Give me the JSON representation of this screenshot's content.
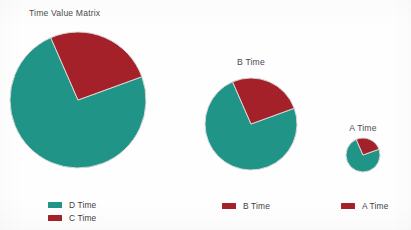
{
  "page": {
    "background": "#fefefe",
    "width": 411,
    "height": 230
  },
  "title": "Time Value Matrix",
  "colors": {
    "teal": "#1f9487",
    "red": "#a5212a",
    "text": "#4c4c4c",
    "wedge_edge": "#d8d8d8"
  },
  "chart_data": {
    "type": "pie",
    "title": "Time Value Matrix",
    "legend_position": "bottom",
    "charts": [
      {
        "name": "pie-d-time",
        "label": "",
        "radius": 68,
        "cx": 78,
        "cy": 100,
        "start_angle": -20,
        "slices": [
          {
            "label": "D Time",
            "value": 74,
            "color": "#1f9487"
          },
          {
            "label": "C Time",
            "value": 26,
            "color": "#a5212a"
          }
        ],
        "legend": [
          {
            "label": "D Time",
            "color": "#1f9487"
          },
          {
            "label": "C Time",
            "color": "#a5212a"
          }
        ]
      },
      {
        "name": "pie-b-time",
        "label": "B Time",
        "radius": 46,
        "cx": 251,
        "cy": 124,
        "start_angle": -20,
        "slices": [
          {
            "label": "B Time Remainder",
            "value": 74,
            "color": "#1f9487"
          },
          {
            "label": "B Time",
            "value": 26,
            "color": "#a5212a"
          }
        ],
        "legend": [
          {
            "label": "B Time",
            "color": "#a5212a"
          }
        ]
      },
      {
        "name": "pie-a-time",
        "label": "A Time",
        "radius": 17,
        "cx": 363,
        "cy": 155,
        "start_angle": -20,
        "slices": [
          {
            "label": "A Time Remainder",
            "value": 74,
            "color": "#1f9487"
          },
          {
            "label": "A Time",
            "value": 26,
            "color": "#a5212a"
          }
        ],
        "legend": [
          {
            "label": "A Time",
            "color": "#a5212a"
          }
        ]
      }
    ]
  },
  "labels": {
    "pie_b": "B Time",
    "pie_a": "A Time"
  },
  "legends": [
    {
      "name": "legend-primary",
      "left": 48,
      "top": 199,
      "items": [
        {
          "label": "D Time",
          "color": "#1f9487"
        },
        {
          "label": "C Time",
          "color": "#a5212a"
        }
      ]
    },
    {
      "name": "legend-b",
      "left": 222,
      "top": 200,
      "items": [
        {
          "label": "B Time",
          "color": "#a5212a"
        }
      ]
    },
    {
      "name": "legend-a",
      "left": 341,
      "top": 200,
      "items": [
        {
          "label": "A Time",
          "color": "#a5212a"
        }
      ]
    }
  ]
}
